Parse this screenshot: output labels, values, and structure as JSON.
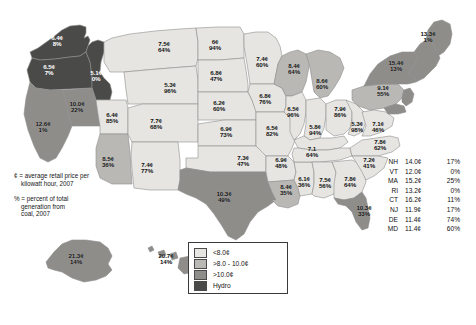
{
  "colors": {
    "light": "#e6e5e1",
    "medium": "#b9b8b4",
    "dark": "#8e8d8a",
    "hydro": "#4a4a49",
    "border": "#8d8d8d",
    "text": "#111111",
    "text_on_dark": "#ffffff"
  },
  "notes": [
    {
      "symbol": "¢",
      "line1": "¢ = average retail price per",
      "line2": "kilowatt hour, 2007"
    },
    {
      "symbol": "%",
      "line1": "% = percent of total",
      "line2": "generation from",
      "line3": "coal, 2007"
    }
  ],
  "legend": {
    "items": [
      {
        "label": "<8.0¢",
        "swatch": "light"
      },
      {
        "label": ">8.0 - 10.0¢",
        "swatch": "medium"
      },
      {
        "label": ">10.0¢",
        "swatch": "dark"
      },
      {
        "label": "Hydro",
        "swatch": "hydro"
      }
    ]
  },
  "side_table": {
    "rows": [
      {
        "abbr": "NH",
        "price": "14.0¢",
        "pct": "17%"
      },
      {
        "abbr": "VT",
        "price": "12.0¢",
        "pct": "0%"
      },
      {
        "abbr": "MA",
        "price": "15.2¢",
        "pct": "25%"
      },
      {
        "abbr": "RI",
        "price": "13.2¢",
        "pct": "0%"
      },
      {
        "abbr": "CT",
        "price": "16.2¢",
        "pct": "11%"
      },
      {
        "abbr": "NJ",
        "price": "11.9¢",
        "pct": "17%"
      },
      {
        "abbr": "DE",
        "price": "11.4¢",
        "pct": "74%"
      },
      {
        "abbr": "MD",
        "price": "11.4¢",
        "pct": "60%"
      }
    ]
  },
  "chart_data": {
    "type": "map",
    "value_units": {
      "price": "cents per kilowatt hour",
      "pct": "percent of total generation from coal"
    },
    "category_bins": [
      {
        "name": "light",
        "label": "<8.0¢"
      },
      {
        "name": "medium",
        "label": ">8.0 - 10.0¢"
      },
      {
        "name": "dark",
        "label": ">10.0¢"
      },
      {
        "name": "hydro",
        "label": "Hydro"
      }
    ],
    "states": [
      {
        "id": "WA",
        "price": "6.4¢",
        "pct": "8%",
        "bin": "hydro",
        "x": 57,
        "y": 41,
        "dark_text": true
      },
      {
        "id": "OR",
        "price": "6.5¢",
        "pct": "7%",
        "bin": "hydro",
        "x": 49,
        "y": 70,
        "dark_text": true
      },
      {
        "id": "ID",
        "price": "5.1¢",
        "pct": "0%",
        "bin": "hydro",
        "x": 96,
        "y": 76,
        "dark_text": true
      },
      {
        "id": "CA",
        "price": "12.6¢",
        "pct": "1%",
        "bin": "dark",
        "x": 43,
        "y": 127,
        "dark_text": false
      },
      {
        "id": "NV",
        "price": "10.0¢",
        "pct": "22%",
        "bin": "dark",
        "x": 77,
        "y": 107,
        "dark_text": false
      },
      {
        "id": "UT",
        "price": "6.4¢",
        "pct": "85%",
        "bin": "light",
        "x": 112,
        "y": 118,
        "dark_text": false
      },
      {
        "id": "MT",
        "price": "7.5¢",
        "pct": "64%",
        "bin": "light",
        "x": 164,
        "y": 47,
        "dark_text": false
      },
      {
        "id": "WY",
        "price": "5.3¢",
        "pct": "96%",
        "bin": "light",
        "x": 170,
        "y": 88,
        "dark_text": false
      },
      {
        "id": "CO",
        "price": "7.7¢",
        "pct": "68%",
        "bin": "light",
        "x": 156,
        "y": 124,
        "dark_text": false
      },
      {
        "id": "AZ",
        "price": "8.5¢",
        "pct": "36%",
        "bin": "medium",
        "x": 108,
        "y": 162,
        "dark_text": false
      },
      {
        "id": "NM",
        "price": "7.4¢",
        "pct": "77%",
        "bin": "light",
        "x": 147,
        "y": 168,
        "dark_text": false
      },
      {
        "id": "ND",
        "price": "6¢",
        "pct": "94%",
        "bin": "light",
        "x": 215,
        "y": 45,
        "dark_text": false
      },
      {
        "id": "SD",
        "price": "6.8¢",
        "pct": "47%",
        "bin": "light",
        "x": 216,
        "y": 76,
        "dark_text": false
      },
      {
        "id": "NE",
        "price": "6.2¢",
        "pct": "60%",
        "bin": "light",
        "x": 219,
        "y": 106,
        "dark_text": false
      },
      {
        "id": "KS",
        "price": "6.9¢",
        "pct": "73%",
        "bin": "light",
        "x": 226,
        "y": 132,
        "dark_text": false
      },
      {
        "id": "OK",
        "price": "7.3¢",
        "pct": "47%",
        "bin": "light",
        "x": 243,
        "y": 161,
        "dark_text": false
      },
      {
        "id": "TX",
        "price": "10.3¢",
        "pct": "49%",
        "bin": "dark",
        "x": 224,
        "y": 197,
        "dark_text": false
      },
      {
        "id": "MN",
        "price": "7.4¢",
        "pct": "60%",
        "bin": "light",
        "x": 262,
        "y": 62,
        "dark_text": false
      },
      {
        "id": "IA",
        "price": "6.8¢",
        "pct": "76%",
        "bin": "light",
        "x": 265,
        "y": 99,
        "dark_text": false
      },
      {
        "id": "MO",
        "price": "6.5¢",
        "pct": "82%",
        "bin": "light",
        "x": 272,
        "y": 131,
        "dark_text": false
      },
      {
        "id": "AR",
        "price": "6.9¢",
        "pct": "48%",
        "bin": "light",
        "x": 281,
        "y": 163,
        "dark_text": false
      },
      {
        "id": "LA",
        "price": "8.4¢",
        "pct": "35%",
        "bin": "medium",
        "x": 286,
        "y": 190,
        "dark_text": false
      },
      {
        "id": "WI",
        "price": "8.4¢",
        "pct": "64%",
        "bin": "medium",
        "x": 294,
        "y": 69,
        "dark_text": false
      },
      {
        "id": "IL",
        "price": "6.5¢",
        "pct": "96%",
        "bin": "light",
        "x": 293,
        "y": 112,
        "dark_text": false
      },
      {
        "id": "MS",
        "price": "6.1¢",
        "pct": "36%",
        "bin": "light",
        "x": 304,
        "y": 182,
        "dark_text": false
      },
      {
        "id": "MI",
        "price": "8.6¢",
        "pct": "60%",
        "bin": "medium",
        "x": 322,
        "y": 84,
        "dark_text": false
      },
      {
        "id": "IN",
        "price": "5.8¢",
        "pct": "94%",
        "bin": "light",
        "x": 315,
        "y": 130,
        "dark_text": false
      },
      {
        "id": "TN",
        "price": "7.1",
        "pct": "64%",
        "bin": "light",
        "x": 312,
        "y": 152,
        "dark_text": false
      },
      {
        "id": "AL",
        "price": "7.5¢",
        "pct": "56%",
        "bin": "light",
        "x": 325,
        "y": 183,
        "dark_text": false
      },
      {
        "id": "OH",
        "price": "7.9¢",
        "pct": "86%",
        "bin": "light",
        "x": 340,
        "y": 112,
        "dark_text": false
      },
      {
        "id": "GA",
        "price": "7.8¢",
        "pct": "64%",
        "bin": "light",
        "x": 350,
        "y": 182,
        "dark_text": false
      },
      {
        "id": "WV",
        "price": "5.3¢",
        "pct": "98%",
        "bin": "light",
        "x": 357,
        "y": 127,
        "dark_text": false
      },
      {
        "id": "SC",
        "price": "7.2¢",
        "pct": "41%",
        "bin": "light",
        "x": 369,
        "y": 163,
        "dark_text": false
      },
      {
        "id": "VA",
        "price": "7.1¢",
        "pct": "46%",
        "bin": "light",
        "x": 378,
        "y": 127,
        "dark_text": false
      },
      {
        "id": "NC",
        "price": "7.8¢",
        "pct": "62%",
        "bin": "light",
        "x": 380,
        "y": 145,
        "dark_text": false
      },
      {
        "id": "PA",
        "price": "9.1¢",
        "pct": "55%",
        "bin": "medium",
        "x": 383,
        "y": 91,
        "dark_text": false
      },
      {
        "id": "NY",
        "price": "15.4¢",
        "pct": "13%",
        "bin": "dark",
        "x": 396,
        "y": 66,
        "dark_text": false
      },
      {
        "id": "ME",
        "price": "13.3¢",
        "pct": "1%",
        "bin": "dark",
        "x": 428,
        "y": 37,
        "dark_text": false
      },
      {
        "id": "FL",
        "price": "10.3¢",
        "pct": "33%",
        "bin": "dark",
        "x": 364,
        "y": 211,
        "dark_text": false
      },
      {
        "id": "AK",
        "price": "21.3¢",
        "pct": "14%",
        "bin": "dark",
        "x": 76,
        "y": 259,
        "dark_text": false
      },
      {
        "id": "HI",
        "price": "20.7¢",
        "pct": "14%",
        "bin": "dark",
        "x": 166,
        "y": 259,
        "dark_text": false
      }
    ]
  }
}
